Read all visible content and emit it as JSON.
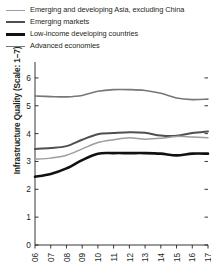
{
  "legend": {
    "position": "top-left",
    "items": [
      {
        "label": "Emerging and developing Asia, excluding China",
        "color": "#9d9d9d",
        "width": 1.6
      },
      {
        "label": "Emerging markets",
        "color": "#4f4f4f",
        "width": 2.0
      },
      {
        "label": "Low-income developing countries",
        "color": "#111111",
        "width": 3.0
      },
      {
        "label": "Advanced economies",
        "color": "#777777",
        "width": 1.8
      }
    ]
  },
  "axes": {
    "ylabel": "Infrastructure Quality (Scale: 1–7)",
    "yticks": [
      "0",
      "1",
      "2",
      "3",
      "4",
      "5",
      "6"
    ],
    "xticks": [
      "06",
      "07",
      "08",
      "09",
      "10",
      "11",
      "12",
      "13",
      "14",
      "15",
      "16",
      "17"
    ]
  },
  "chart_data": {
    "type": "line",
    "title": "",
    "xlabel": "",
    "ylabel": "Infrastructure Quality (Scale: 1–7)",
    "x": [
      "06",
      "07",
      "08",
      "09",
      "10",
      "11",
      "12",
      "13",
      "14",
      "15",
      "16",
      "17"
    ],
    "ylim": [
      0,
      6.5
    ],
    "yticks": [
      0,
      1,
      2,
      3,
      4,
      5,
      6
    ],
    "grid": false,
    "series": [
      {
        "name": "Advanced economies",
        "color": "#777777",
        "values": [
          5.35,
          5.33,
          5.32,
          5.37,
          5.52,
          5.58,
          5.58,
          5.55,
          5.45,
          5.28,
          5.22,
          5.24
        ]
      },
      {
        "name": "Emerging markets",
        "color": "#4f4f4f",
        "values": [
          3.45,
          3.48,
          3.55,
          3.78,
          3.98,
          4.02,
          4.05,
          4.03,
          3.93,
          3.92,
          4.02,
          4.08
        ]
      },
      {
        "name": "Emerging and developing Asia, excluding China",
        "color": "#9d9d9d",
        "values": [
          3.08,
          3.12,
          3.22,
          3.45,
          3.68,
          3.78,
          3.85,
          3.8,
          3.83,
          3.9,
          3.88,
          3.85
        ]
      },
      {
        "name": "Low-income developing countries",
        "color": "#111111",
        "values": [
          2.45,
          2.55,
          2.75,
          3.05,
          3.28,
          3.3,
          3.3,
          3.3,
          3.28,
          3.22,
          3.28,
          3.28
        ]
      }
    ]
  }
}
